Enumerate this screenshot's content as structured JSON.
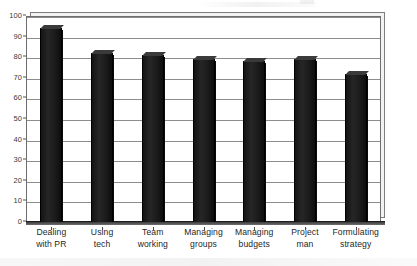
{
  "chart_data": {
    "type": "bar",
    "title": "",
    "subtitle": "",
    "xlabel": "",
    "ylabel": "",
    "categories": [
      "Dealing with PR",
      "Using tech",
      "Team working",
      "Managing groups",
      "Managing budgets",
      "Project man",
      "Formulating strategy"
    ],
    "category_lines": [
      [
        "Dealing",
        "with PR"
      ],
      [
        "Using",
        "tech"
      ],
      [
        "Team",
        "working"
      ],
      [
        "Managing",
        "groups"
      ],
      [
        "Managing",
        "budgets"
      ],
      [
        "Project",
        "man"
      ],
      [
        "Formulating",
        "strategy"
      ]
    ],
    "values": [
      94,
      82,
      81,
      79,
      78,
      79,
      72
    ],
    "ylim": [
      0,
      100
    ],
    "ytick_step": 10,
    "yticks": [
      100,
      90,
      80,
      70,
      60,
      50,
      40,
      30,
      20,
      10,
      0
    ],
    "grid": true,
    "legend": false,
    "legend_position": "none",
    "series": [
      {
        "name": "",
        "values": [
          94,
          82,
          81,
          79,
          78,
          79,
          72
        ]
      }
    ]
  },
  "style": {
    "bar_color": "#1a1a1a",
    "grid_color": "#8d8d8d",
    "axis_color": "#6e6e6e",
    "text_color": "#1f1f1f",
    "background": "#ffffff"
  }
}
